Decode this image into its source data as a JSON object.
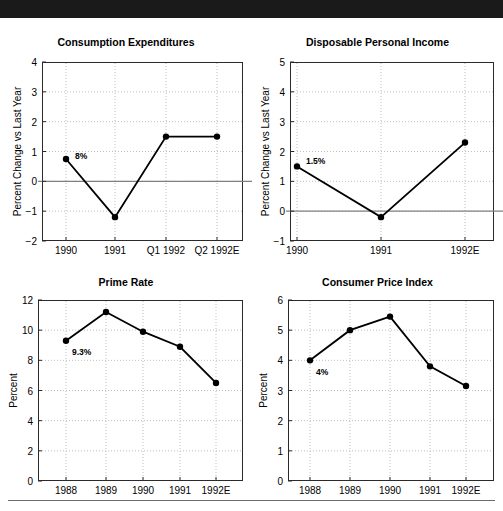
{
  "exhibit": {
    "label": "EXHIBIT 5:",
    "title": "U.S. Economic Overview"
  },
  "colors": {
    "bar_background": "#1a1a1a",
    "bar_text": "#ffffff",
    "line": "#000000",
    "marker": "#000000",
    "grid": "#bfbfbf",
    "zero_line": "#808080",
    "frame": "#2a2a2a"
  },
  "chart_data": [
    {
      "id": "consumption-expenditures",
      "type": "line",
      "title": "Consumption Expenditures",
      "xlabel": "",
      "ylabel": "Percent Change vs Last Year",
      "categories": [
        "1990",
        "1991",
        "Q1 1992",
        "Q2 1992E"
      ],
      "values": [
        0.75,
        -1.2,
        1.5,
        1.5
      ],
      "ylim": [
        -2,
        4
      ],
      "yticks": [
        -2,
        -1,
        0,
        1,
        2,
        3,
        4
      ],
      "ytick_labels": [
        "−2",
        "−1",
        "0",
        "1",
        "2",
        "3",
        "4"
      ],
      "grid": true,
      "zero_line": true,
      "legend": "none",
      "annotations": [
        {
          "text": "8%",
          "category": "1990",
          "value": 0.75
        }
      ]
    },
    {
      "id": "disposable-personal-income",
      "type": "line",
      "title": "Disposable Personal Income",
      "xlabel": "",
      "ylabel": "Percent Change vs Last Year",
      "categories": [
        "1990",
        "1991",
        "1992E"
      ],
      "values": [
        1.5,
        -0.2,
        2.3
      ],
      "ylim": [
        -1,
        5
      ],
      "yticks": [
        -1,
        0,
        1,
        2,
        3,
        4,
        5
      ],
      "ytick_labels": [
        "−1",
        "0",
        "1",
        "2",
        "3",
        "4",
        "5"
      ],
      "grid": true,
      "zero_line": true,
      "legend": "none",
      "annotations": [
        {
          "text": "1.5%",
          "category": "1990",
          "value": 1.5
        }
      ]
    },
    {
      "id": "prime-rate",
      "type": "line",
      "title": "Prime Rate",
      "xlabel": "",
      "ylabel": "Percent",
      "categories": [
        "1988",
        "1989",
        "1990",
        "1991",
        "1992E"
      ],
      "values": [
        9.3,
        11.2,
        9.9,
        8.9,
        6.5
      ],
      "ylim": [
        0,
        12
      ],
      "yticks": [
        0,
        2,
        4,
        6,
        8,
        10,
        12
      ],
      "ytick_labels": [
        "0",
        "2",
        "4",
        "6",
        "8",
        "10",
        "12"
      ],
      "grid": true,
      "zero_line": false,
      "legend": "none",
      "annotations": [
        {
          "text": "9.3%",
          "category": "1988",
          "value": 9.3
        }
      ]
    },
    {
      "id": "consumer-price-index",
      "type": "line",
      "title": "Consumer Price Index",
      "xlabel": "",
      "ylabel": "Percent",
      "categories": [
        "1988",
        "1989",
        "1990",
        "1991",
        "1992E"
      ],
      "values": [
        4.0,
        5.0,
        5.45,
        3.8,
        3.15
      ],
      "ylim": [
        0,
        6
      ],
      "yticks": [
        0,
        1,
        2,
        3,
        4,
        5,
        6
      ],
      "ytick_labels": [
        "0",
        "1",
        "2",
        "3",
        "4",
        "5",
        "6"
      ],
      "grid": true,
      "zero_line": false,
      "legend": "none",
      "annotations": [
        {
          "text": "4%",
          "category": "1988",
          "value": 4.0
        }
      ]
    }
  ]
}
